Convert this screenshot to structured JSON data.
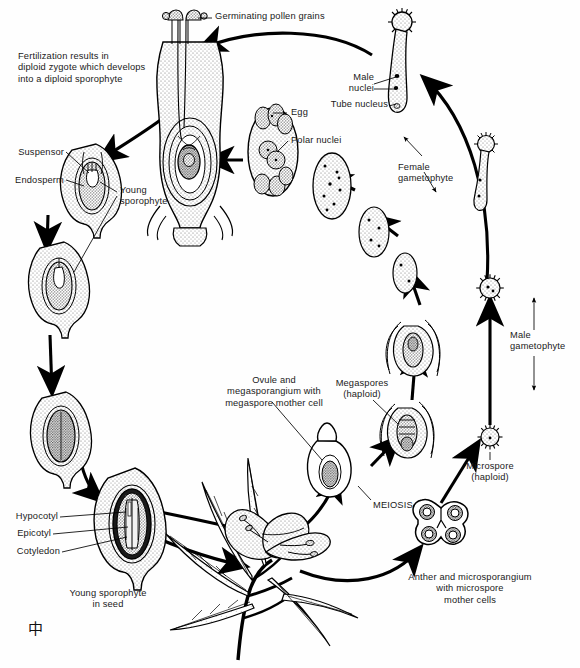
{
  "diagram": {
    "signature": "中"
  },
  "colors": {
    "ink": "#000000",
    "stipple_light": "#d9d9d9",
    "stipple_mid": "#b3b3b3",
    "stipple_dark": "#8c8c8c",
    "background": "#ffffff"
  },
  "labels": {
    "germinating_pollen": "Germinating pollen grains",
    "fertilization_note": "Fertilization results in\ndiploid zygote which develops\ninto a diploid sporophyte",
    "suspensor": "Suspensor",
    "endosperm": "Endosperm",
    "young_sporophyte": "Young\nsporophyte",
    "egg": "Egg",
    "polar_nuclei": "Polar nuclei",
    "male_nuclei": "Male\nnuclei",
    "tube_nucleus": "Tube nucleus",
    "female_gametophyte": "Female\ngametophyte",
    "male_gametophyte": "Male\ngametophyte",
    "microspore_haploid": "Microspore\n(haploid)",
    "megaspores_haploid": "Megaspores\n(haploid)",
    "meiosis": "MEIOSIS",
    "ovule_megasporangium": "Ovule and\nmegasporangium with\nmegaspore mother cell",
    "anther_microsporangium": "Anther and microsporangium\nwith microspore\nmother cells",
    "hypocotyl": "Hypocotyl",
    "epicotyl": "Epicotyl",
    "cotyledon": "Cotyledon",
    "young_sporophyte_seed": "Young sporophyte\nin seed"
  },
  "stages": [
    {
      "id": "pistil-fertilization",
      "name": "Pistil with pollen tubes reaching ovule",
      "ploidy": "diploid"
    },
    {
      "id": "embryo-suspensor",
      "name": "Young embryo with suspensor and endosperm",
      "ploidy": "diploid"
    },
    {
      "id": "embryo-mid",
      "name": "Developing embryo in ovule",
      "ploidy": "diploid"
    },
    {
      "id": "seed-mature",
      "name": "Mature seed",
      "ploidy": "diploid"
    },
    {
      "id": "seed-dissection",
      "name": "Young sporophyte in seed",
      "ploidy": "diploid"
    },
    {
      "id": "mature-plant",
      "name": "Mature flowering sporophyte plant",
      "ploidy": "diploid"
    },
    {
      "id": "anther-section",
      "name": "Anther and microsporangium with microspore mother cells",
      "ploidy": "diploid"
    },
    {
      "id": "microspore",
      "name": "Microspore (haploid)",
      "ploidy": "haploid"
    },
    {
      "id": "pollen-grain",
      "name": "Pollen grain / male gametophyte",
      "ploidy": "haploid"
    },
    {
      "id": "pollen-tube",
      "name": "Germinated pollen grain with tube nucleus and male nuclei",
      "ploidy": "haploid"
    },
    {
      "id": "ovule-mmc",
      "name": "Ovule and megasporangium with megaspore mother cell",
      "ploidy": "diploid"
    },
    {
      "id": "megaspores",
      "name": "Megaspores (haploid)",
      "ploidy": "haploid"
    },
    {
      "id": "embryo-sac-young",
      "name": "Developing embryo sac",
      "ploidy": "haploid"
    },
    {
      "id": "embryo-sac-mature",
      "name": "Mature female gametophyte with egg and polar nuclei",
      "ploidy": "haploid"
    }
  ],
  "callouts": {
    "egg_cell": "Egg",
    "polar_nuclei_cell": "Polar nuclei",
    "male_nuclei_cell": "Male nuclei",
    "tube_nucleus_cell": "Tube nucleus",
    "suspensor_part": "Suspensor",
    "endosperm_part": "Endosperm",
    "hypocotyl_part": "Hypocotyl",
    "epicotyl_part": "Epicotyl",
    "cotyledon_part": "Cotyledon"
  }
}
